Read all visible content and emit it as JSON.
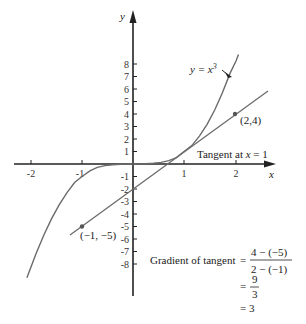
{
  "diagram": {
    "axes": {
      "x_label": "x",
      "y_label": "y",
      "x_ticks": [
        "-2",
        "-1",
        "1",
        "2"
      ],
      "y_ticks_pos": [
        "1",
        "2",
        "3",
        "4",
        "5",
        "6",
        "7",
        "8"
      ],
      "y_ticks_neg": [
        "-1",
        "-2",
        "-3",
        "-4",
        "-5",
        "-6",
        "-7",
        "-8"
      ]
    },
    "curve": {
      "label_prefix": "y = x",
      "label_sup": "3",
      "equation": "y = x^3",
      "color": "#6b6b6b"
    },
    "tangent": {
      "label": "Tangent at x = 1",
      "label_prefix": "Tangent at ",
      "label_var": "x",
      "label_suffix": " = 1",
      "equation": "y = 3x - 2",
      "color": "#6b6b6b"
    },
    "points": [
      {
        "label": "(2,4)",
        "x": 2,
        "y": 4
      },
      {
        "label": "(−1, −5)",
        "x": -1,
        "y": -5
      }
    ],
    "gradient": {
      "prefix": "Gradient of tangent",
      "eq": "=",
      "num1": "4 − (−5)",
      "den1": "2 − (−1)",
      "num2": "9",
      "den2": "3",
      "result": "= 3"
    }
  }
}
